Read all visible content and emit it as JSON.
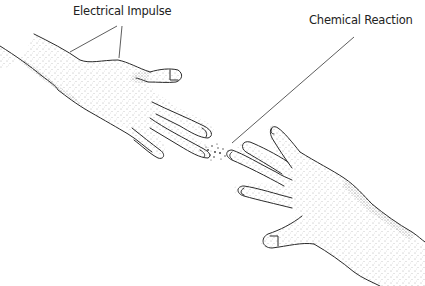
{
  "diagram": {
    "labels": {
      "electrical": "Electrical Impulse",
      "chemical": "Chemical Reaction"
    },
    "elements": {
      "left_hand": "left-hand-reaching",
      "right_hand": "right-hand-reaching",
      "gap_particles": "chemical-particles"
    },
    "colors": {
      "line": "#2a2a2a",
      "stipple": "#555555",
      "background": "#ffffff"
    }
  }
}
